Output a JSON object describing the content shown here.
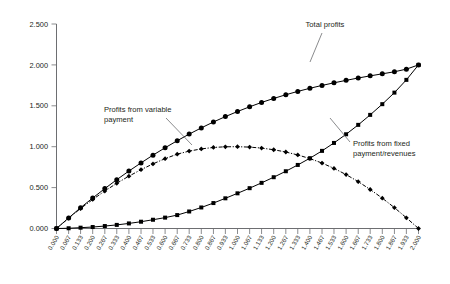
{
  "chart_data": {
    "type": "line",
    "title": "",
    "xlabel": "Bonus β",
    "ylabel": "",
    "xlim": [
      0,
      2
    ],
    "ylim": [
      0,
      2.5
    ],
    "grid": false,
    "legend_position": "inline-annotations",
    "x": [
      0.0,
      0.067,
      0.133,
      0.2,
      0.267,
      0.333,
      0.4,
      0.467,
      0.533,
      0.6,
      0.667,
      0.733,
      0.8,
      0.867,
      0.933,
      1.0,
      1.067,
      1.133,
      1.2,
      1.267,
      1.333,
      1.4,
      1.467,
      1.533,
      1.6,
      1.667,
      1.733,
      1.8,
      1.867,
      1.933,
      2.0
    ],
    "xticklabels": [
      "0.000",
      "0.067",
      "0.133",
      "0.200",
      "0.267",
      "0.333",
      "0.400",
      "0.467",
      "0.533",
      "0.600",
      "0.667",
      "0.733",
      "0.800",
      "0.867",
      "0.933",
      "1.000",
      "1.067",
      "1.133",
      "1.200",
      "1.267",
      "1.333",
      "1.400",
      "1.467",
      "1.533",
      "1.600",
      "1.667",
      "1.733",
      "1.800",
      "1.867",
      "1.933",
      "2.000"
    ],
    "yticklabels": [
      "0.000",
      "0.500",
      "1.000",
      "1.500",
      "2.000",
      "2.500"
    ],
    "yticks": [
      0.0,
      0.5,
      1.0,
      1.5,
      2.0,
      2.5
    ],
    "series": [
      {
        "name": "Total profits",
        "marker": "circle",
        "linestyle": "solid",
        "values": [
          0.0,
          0.129,
          0.254,
          0.373,
          0.488,
          0.597,
          0.702,
          0.802,
          0.897,
          0.987,
          1.073,
          1.154,
          1.23,
          1.302,
          1.368,
          1.43,
          1.488,
          1.541,
          1.59,
          1.635,
          1.676,
          1.714,
          1.749,
          1.781,
          1.811,
          1.84,
          1.866,
          1.891,
          1.916,
          1.948,
          2.0
        ]
      },
      {
        "name": "Profits from variable payment",
        "marker": "diamond",
        "linestyle": "dashdot",
        "values": [
          0.0,
          0.126,
          0.244,
          0.355,
          0.458,
          0.553,
          0.64,
          0.719,
          0.79,
          0.854,
          0.909,
          0.946,
          0.973,
          0.991,
          0.999,
          1.0,
          0.995,
          0.983,
          0.963,
          0.935,
          0.899,
          0.855,
          0.8,
          0.735,
          0.659,
          0.573,
          0.477,
          0.371,
          0.255,
          0.131,
          0.0
        ]
      },
      {
        "name": "Profits from fixed payment/revenues",
        "marker": "square",
        "linestyle": "solid",
        "values": [
          0.0,
          0.003,
          0.01,
          0.018,
          0.03,
          0.044,
          0.062,
          0.083,
          0.107,
          0.133,
          0.164,
          0.208,
          0.257,
          0.311,
          0.369,
          0.43,
          0.493,
          0.558,
          0.627,
          0.7,
          0.777,
          0.859,
          0.949,
          1.046,
          1.152,
          1.267,
          1.389,
          1.52,
          1.661,
          1.817,
          2.0
        ]
      }
    ],
    "annotations": [
      {
        "name": "total-profits",
        "text": "Total profits"
      },
      {
        "name": "variable-payment",
        "text": "Profits from variable payment",
        "line1": "Profits from variable",
        "line2": "payment"
      },
      {
        "name": "fixed-payment",
        "text": "Profits from fixed payment/revenues",
        "line1": "Profits from fixed",
        "line2": "payment/revenues"
      }
    ]
  }
}
